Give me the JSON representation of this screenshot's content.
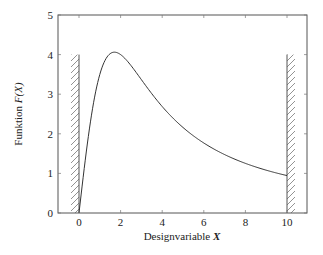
{
  "chart_data": {
    "type": "line",
    "title": "",
    "xlabel": "Designvariable X",
    "ylabel": "Funktion F(X)",
    "xlim": [
      -1,
      11
    ],
    "ylim": [
      0,
      5
    ],
    "x_ticks": [
      0,
      2,
      4,
      6,
      8,
      10
    ],
    "y_ticks": [
      0,
      1,
      2,
      3,
      4,
      5
    ],
    "grid": false,
    "legend": null,
    "series": [
      {
        "name": "F(X)",
        "x": [
          0,
          0.5,
          1,
          1.5,
          2,
          2.5,
          3,
          3.5,
          4,
          5,
          6,
          7,
          8,
          9,
          10
        ],
        "y": [
          0,
          1.6,
          2.9,
          3.7,
          4.0,
          3.85,
          3.5,
          3.1,
          2.75,
          2.2,
          1.8,
          1.5,
          1.28,
          1.1,
          0.95
        ]
      }
    ],
    "annotations": [
      {
        "type": "hatched-constraint",
        "x": 0,
        "y_range": [
          0,
          4
        ],
        "side": "left",
        "label": "lower bound"
      },
      {
        "type": "hatched-constraint",
        "x": 10,
        "y_range": [
          0,
          4
        ],
        "side": "right",
        "label": "upper bound"
      }
    ]
  },
  "labels": {
    "xlabel_text": "Designvariable ",
    "xlabel_var": "X",
    "ylabel_text": "Funktion ",
    "ylabel_var": "F(X)"
  },
  "colors": {
    "line": "#333333",
    "axis": "#555555",
    "hatch": "#777777"
  }
}
